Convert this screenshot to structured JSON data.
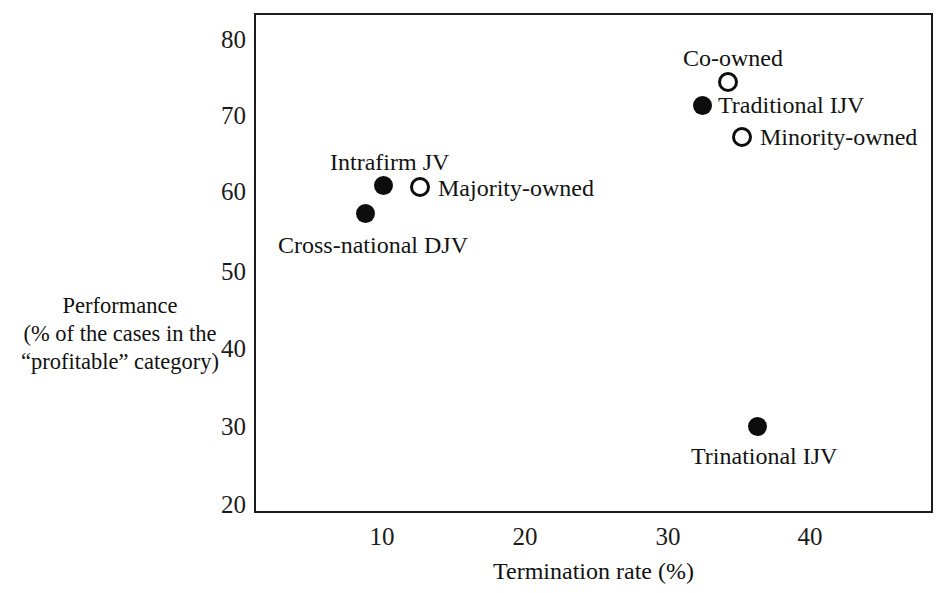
{
  "chart_data": {
    "type": "scatter",
    "title": "",
    "xlabel": "Termination rate (%)",
    "ylabel_lines": [
      "Performance",
      "(% of the cases in the",
      "“profitable” category)"
    ],
    "xlim": [
      2,
      49.5
    ],
    "ylim": [
      18.5,
      83.5
    ],
    "xticks": [
      10,
      20,
      30,
      40
    ],
    "yticks": [
      80,
      70,
      60,
      50,
      40,
      30,
      20
    ],
    "grid": false,
    "legend": "none (points labelled inline)",
    "marker_styles": {
      "filled": "solid black circle",
      "open": "hollow circle with black outline"
    },
    "points": [
      {
        "label": "Cross-national DJV",
        "x": 8.8,
        "y": 57.3,
        "style": "filled",
        "label_pos": "below-left",
        "px": 365,
        "py": 213,
        "label_px": 278,
        "label_py": 232
      },
      {
        "label": "Intrafirm JV",
        "x": 10.1,
        "y": 61.2,
        "style": "filled",
        "label_pos": "above",
        "px": 383,
        "py": 185,
        "label_px": 330,
        "label_py": 149
      },
      {
        "label": "Majority-owned",
        "x": 12.7,
        "y": 60.9,
        "style": "open",
        "label_pos": "right",
        "px": 420,
        "py": 187,
        "label_px": 438,
        "label_py": 175
      },
      {
        "label": "Traditional IJV",
        "x": 32.8,
        "y": 71.4,
        "style": "filled",
        "label_pos": "right",
        "px": 702,
        "py": 105,
        "label_px": 718,
        "label_py": 92
      },
      {
        "label": "Co-owned",
        "x": 34.7,
        "y": 74.7,
        "style": "open",
        "label_pos": "above",
        "px": 728,
        "py": 82,
        "label_px": 683,
        "label_py": 45
      },
      {
        "label": "Minority-owned",
        "x": 35.7,
        "y": 66.6,
        "style": "open",
        "label_pos": "right",
        "px": 742,
        "py": 137,
        "label_px": 760,
        "label_py": 124
      },
      {
        "label": "Trinational IJV",
        "x": 36.8,
        "y": 30.1,
        "style": "filled",
        "label_pos": "below",
        "px": 757,
        "py": 426,
        "label_px": 691,
        "label_py": 443
      }
    ]
  },
  "axes": {
    "x_tick_px": {
      "10": 382,
      "20": 525,
      "30": 668,
      "40": 810
    },
    "y_tick_px": {
      "80": 40,
      "70": 116,
      "60": 192,
      "50": 272,
      "40": 349,
      "30": 427,
      "20": 505
    }
  },
  "colors": {
    "frame": "#1c1c1c",
    "marker": "#0d0d0d",
    "text": "#131313",
    "background": "#ffffff"
  }
}
